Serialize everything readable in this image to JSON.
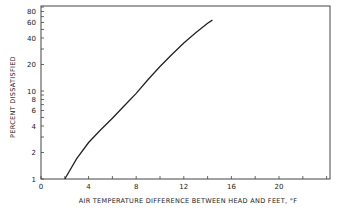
{
  "chart_data": {
    "type": "line",
    "title": "",
    "xlabel": "AIR TEMPERATURE DIFFERENCE BETWEEN HEAD AND FEET,  °F",
    "ylabel": "PERCENT DISSATISFIED",
    "xlim": [
      0,
      24
    ],
    "ylim": [
      1,
      100
    ],
    "yscale": "log",
    "x_ticks": [
      0,
      4,
      8,
      12,
      16,
      20
    ],
    "x_tick_labels": [
      "0",
      "4",
      "8",
      "12",
      "16",
      "20"
    ],
    "y_ticks": [
      1,
      2,
      4,
      6,
      8,
      10,
      20,
      40,
      60,
      80
    ],
    "y_tick_labels": [
      "1",
      "2",
      "4",
      "6",
      "8",
      "10",
      "20",
      "40",
      "60",
      "80"
    ],
    "grid": false,
    "legend": null,
    "series": [
      {
        "name": "Percent dissatisfied",
        "x": [
          2.0,
          3.0,
          4.0,
          5.0,
          6.0,
          7.0,
          8.0,
          9.0,
          10.0,
          11.0,
          12.0,
          13.0,
          14.0,
          14.4
        ],
        "y": [
          1.0,
          1.7,
          2.6,
          3.6,
          4.9,
          6.8,
          9.4,
          13.5,
          19,
          26,
          35,
          46,
          59,
          64
        ]
      }
    ]
  }
}
